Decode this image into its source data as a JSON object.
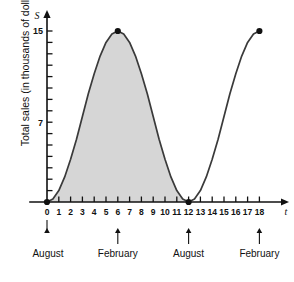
{
  "chart_data": {
    "type": "line",
    "title": "",
    "xlabel": "t",
    "ylabel": "Total sales (in thousands of dollars)",
    "y_axis_symbol": "S",
    "x_axis_symbol": "t",
    "xlim": [
      0,
      19.5
    ],
    "ylim": [
      0,
      16.5
    ],
    "grid": false,
    "legend": null,
    "x_tick_labels": [
      "0",
      "1",
      "2",
      "3",
      "4",
      "5",
      "6",
      "7",
      "8",
      "9",
      "10",
      "11",
      "12",
      "13",
      "14",
      "15",
      "16",
      "17",
      "18"
    ],
    "x_tick_values": [
      0,
      1,
      2,
      3,
      4,
      5,
      6,
      7,
      8,
      9,
      10,
      11,
      12,
      13,
      14,
      15,
      16,
      17,
      18
    ],
    "y_tick_labels": [
      "7",
      "15"
    ],
    "y_tick_values": [
      7,
      15
    ],
    "y_minor_tick_values": [
      1,
      2,
      3,
      4,
      5,
      6,
      8,
      9,
      10,
      11,
      12,
      13,
      14
    ],
    "curve_formula": "S = 7.5 - 7.5*cos(pi*t/6)",
    "x": [
      0,
      0.5,
      1,
      1.5,
      2,
      2.5,
      3,
      3.5,
      4,
      4.5,
      5,
      5.5,
      6,
      6.5,
      7,
      7.5,
      8,
      8.5,
      9,
      9.5,
      10,
      10.5,
      11,
      11.5,
      12,
      12.5,
      13,
      13.5,
      14,
      14.5,
      15,
      15.5,
      16,
      16.5,
      17,
      17.5,
      18
    ],
    "values": [
      0,
      0.26,
      1.0,
      2.2,
      3.75,
      5.5,
      7.5,
      9.5,
      11.25,
      12.8,
      14.0,
      14.74,
      15.0,
      14.74,
      14.0,
      12.8,
      11.25,
      9.5,
      7.5,
      5.5,
      3.75,
      2.2,
      1.0,
      0.26,
      0,
      0.26,
      1.0,
      2.2,
      3.75,
      5.5,
      7.5,
      9.5,
      11.25,
      12.8,
      14.0,
      14.74,
      15.0
    ],
    "markers": [
      {
        "x": 0,
        "y": 0
      },
      {
        "x": 6,
        "y": 15
      },
      {
        "x": 12,
        "y": 0
      },
      {
        "x": 18,
        "y": 15
      }
    ],
    "shaded_region": {
      "from": 0,
      "to": 12,
      "color": "#d6d6d6",
      "description": "area under curve from t=0 to t=12"
    },
    "annotations": [
      {
        "label": "August",
        "x": 0
      },
      {
        "label": "February",
        "x": 6
      },
      {
        "label": "August",
        "x": 12
      },
      {
        "label": "February",
        "x": 18
      }
    ],
    "colors": {
      "curve": "#3a3a3a",
      "axis": "#111111",
      "shading": "#d6d6d6",
      "marker": "#111111"
    }
  }
}
